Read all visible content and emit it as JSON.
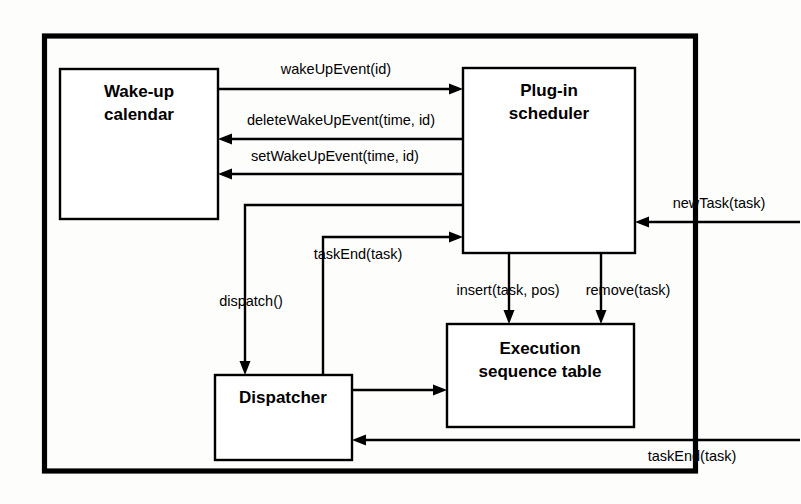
{
  "diagram": {
    "background_color": "#fdfdfc",
    "line_color": "#000000",
    "box_fill": "#ffffff",
    "nodes": [
      {
        "id": "wakeup",
        "label_line1": "Wake-up",
        "label_line2": "calendar"
      },
      {
        "id": "scheduler",
        "label_line1": "Plug-in",
        "label_line2": "scheduler"
      },
      {
        "id": "dispatcher",
        "label_line1": "Dispatcher",
        "label_line2": ""
      },
      {
        "id": "exectable",
        "label_line1": "Execution",
        "label_line2": "sequence table"
      }
    ],
    "edges": [
      {
        "id": "wakeUpEvent",
        "label": "wakeUpEvent(id)",
        "from": "wakeup",
        "to": "scheduler"
      },
      {
        "id": "deleteWakeUpEvent",
        "label": "deleteWakeUpEvent(time, id)",
        "from": "scheduler",
        "to": "wakeup"
      },
      {
        "id": "setWakeUpEvent",
        "label": "setWakeUpEvent(time, id)",
        "from": "scheduler",
        "to": "wakeup"
      },
      {
        "id": "newTask",
        "label": "newTask(task)",
        "from": "external",
        "to": "scheduler"
      },
      {
        "id": "dispatch",
        "label": "dispatch()",
        "from": "scheduler",
        "to": "dispatcher"
      },
      {
        "id": "taskEndUp",
        "label": "taskEnd(task)",
        "from": "dispatcher",
        "to": "scheduler"
      },
      {
        "id": "insert",
        "label": "insert(task, pos)",
        "from": "scheduler",
        "to": "exectable"
      },
      {
        "id": "remove",
        "label": "remove(task)",
        "from": "scheduler",
        "to": "exectable"
      },
      {
        "id": "dispatcherToTable",
        "label": "",
        "from": "dispatcher",
        "to": "exectable"
      },
      {
        "id": "taskEndBottom",
        "label": "taskEnd(task)",
        "from": "external",
        "to": "dispatcher"
      }
    ]
  }
}
